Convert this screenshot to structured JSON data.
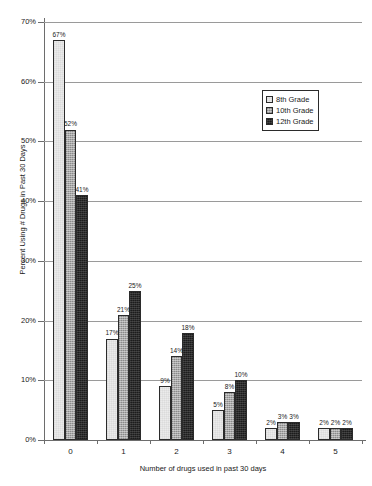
{
  "chart_data": {
    "type": "bar",
    "title": "",
    "xlabel": "Number of drugs used in past 30 days",
    "ylabel": "Percent Using # Drugs in Past 30 Days",
    "categories": [
      "0",
      "1",
      "2",
      "3",
      "4",
      "5"
    ],
    "ylim": [
      0,
      70
    ],
    "ytick_labels": [
      "0%",
      "10%",
      "20%",
      "30%",
      "40%",
      "50%",
      "60%",
      "70%"
    ],
    "ytick_values": [
      0,
      10,
      20,
      30,
      40,
      50,
      60,
      70
    ],
    "grid": true,
    "legend_position": "top-right",
    "series": [
      {
        "name": "8th Grade",
        "color": "#ebebeb",
        "values": [
          67,
          17,
          9,
          5,
          2,
          2
        ],
        "labels": [
          "67%",
          "17%",
          "9%",
          "5%",
          "2%",
          "2%"
        ]
      },
      {
        "name": "10th Grade",
        "color": "#a8a8a8",
        "values": [
          52,
          21,
          14,
          8,
          3,
          2
        ],
        "labels": [
          "52%",
          "21%",
          "14%",
          "8%",
          "3%",
          "2%"
        ]
      },
      {
        "name": "12th Grade",
        "color": "#1c1c1c",
        "values": [
          41,
          25,
          18,
          10,
          3,
          2
        ],
        "labels": [
          "41%",
          "25%",
          "18%",
          "10%",
          "3%",
          "2%"
        ]
      }
    ]
  },
  "legend": {
    "items": [
      {
        "label": "8th Grade"
      },
      {
        "label": "10th Grade"
      },
      {
        "label": "12th Grade"
      }
    ]
  },
  "axes": {
    "y_title": "Percent Using # Drugs in Past 30 Days",
    "x_title": "Number of drugs used in past 30 days"
  }
}
